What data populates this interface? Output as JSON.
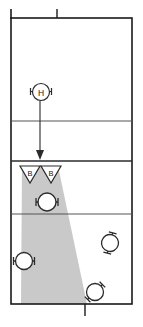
{
  "diagram": {
    "background_color": "#ffffff",
    "line_color": "#1a1a1a",
    "inner_line_color": "#4d4d4d",
    "shade_color": "#c9c9c9",
    "field": {
      "x": 11,
      "y": 18,
      "width": 121,
      "height": 286
    },
    "ticks": [
      {
        "name": "top-left-tick",
        "x": 11,
        "y1": 9,
        "y2": 18
      },
      {
        "name": "top-middle-tick",
        "x": 57,
        "y1": 9,
        "y2": 18
      },
      {
        "name": "bottom-middle-tick",
        "x": 85,
        "y1": 304,
        "y2": 316
      }
    ],
    "dividers": [
      {
        "name": "divider-upper",
        "y": 121
      },
      {
        "name": "divider-middle",
        "y": 161
      },
      {
        "name": "divider-lower",
        "y": 214
      }
    ],
    "beam": {
      "name": "shaded-beam",
      "top_left_x": 22,
      "top_right_x": 58,
      "top_y": 166,
      "bottom_left_x": 21,
      "bottom_right_x": 87,
      "bottom_y": 304,
      "color": "#c9c9c9"
    },
    "arrow": {
      "name": "movement-arrow",
      "x": 40,
      "y_start": 101,
      "y_end": 158,
      "direction": "down"
    },
    "markers": [
      {
        "name": "player-marker-h",
        "label": "H",
        "cx": 41,
        "cy": 92,
        "r": 8.5,
        "arm_style": "horizontal",
        "rotation": 0
      },
      {
        "name": "player-marker-center",
        "label": "",
        "cx": 47,
        "cy": 202,
        "r": 9,
        "arm_style": "horizontal",
        "rotation": 0
      },
      {
        "name": "player-marker-left",
        "label": "",
        "cx": 24,
        "cy": 261,
        "r": 8.5,
        "arm_style": "horizontal",
        "rotation": 0
      },
      {
        "name": "player-marker-right",
        "label": "",
        "cx": 110,
        "cy": 243,
        "r": 8.5,
        "arm_style": "horizontal",
        "rotation": 105
      },
      {
        "name": "player-marker-bottom-right",
        "label": "",
        "cx": 95,
        "cy": 292,
        "r": 8.5,
        "arm_style": "horizontal",
        "rotation": 135
      }
    ],
    "flags": [
      {
        "name": "flag-marker-b-left",
        "label": "B",
        "apex_x": 30,
        "top_y": 166,
        "half_width": 10,
        "height": 17
      },
      {
        "name": "flag-marker-b-right",
        "label": "B",
        "apex_x": 51,
        "top_y": 166,
        "half_width": 10,
        "height": 17
      }
    ]
  }
}
